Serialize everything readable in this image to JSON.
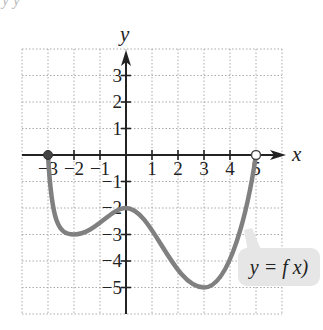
{
  "header_fragment": "y y",
  "chart_data": {
    "type": "line",
    "title": "",
    "xlabel": "x",
    "ylabel": "y",
    "xlim": [
      -4,
      6
    ],
    "ylim": [
      -6,
      4
    ],
    "grid": true,
    "grid_style": "dotted",
    "x_ticks": [
      -3,
      -2,
      -1,
      1,
      2,
      3,
      4,
      5
    ],
    "x_tick_labels": [
      "−3",
      "−2",
      "−1",
      "1",
      "2",
      "3",
      "4",
      "5"
    ],
    "y_ticks": [
      3,
      2,
      1,
      -1,
      -2,
      -3,
      -4,
      -5
    ],
    "y_tick_labels": [
      "3",
      "2",
      "1",
      "−1",
      "−2",
      "−3",
      "−4",
      "−5"
    ],
    "series": [
      {
        "name": "y = f(x)",
        "points": [
          [
            -3,
            0
          ],
          [
            -2,
            -3
          ],
          [
            0,
            -2
          ],
          [
            3,
            -5
          ],
          [
            5,
            0
          ]
        ],
        "start_point": {
          "x": -3,
          "y": 0,
          "style": "closed"
        },
        "end_point": {
          "x": 5,
          "y": 0,
          "style": "open"
        },
        "color": "#808080"
      }
    ],
    "annotations": [
      {
        "text": "y = f x)",
        "position": "lower-right",
        "callout": true
      }
    ]
  },
  "colors": {
    "curve": "#808080",
    "grid": "#aaaaaa",
    "axis": "#222222",
    "callout_bg": "#e6e6e6"
  }
}
